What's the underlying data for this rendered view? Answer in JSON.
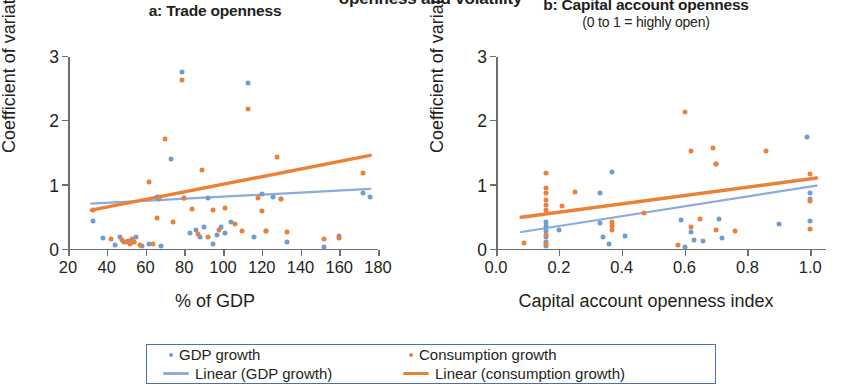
{
  "figure": {
    "supertitle": "openness and volatility",
    "colors": {
      "gdp_growth": "#6f9bd6",
      "consumption_growth": "#ed8037",
      "gdp_trend": "#89abdd",
      "consumption_trend": "#ed8037",
      "axis": "#6d6e71",
      "legend_border": "#4a70b0"
    }
  },
  "legend": {
    "items": [
      {
        "label": "GDP growth",
        "marker": "dot",
        "color": "#6f9bd6"
      },
      {
        "label": "Consumption growth",
        "marker": "dot",
        "color": "#ed8037"
      },
      {
        "label": "Linear (GDP growth)",
        "marker": "line",
        "color": "#89abdd"
      },
      {
        "label": "Linear (consumption growth)",
        "marker": "line",
        "color": "#ed8037"
      }
    ]
  },
  "chart_data": [
    {
      "type": "scatter",
      "panel": "a",
      "title": "a: Trade openness",
      "subtitle": "",
      "xlabel": "% of GDP",
      "ylabel": "Coefficient of variation",
      "xlim": [
        20,
        180
      ],
      "ylim": [
        0,
        3
      ],
      "xticks": [
        20,
        40,
        60,
        80,
        100,
        120,
        140,
        160,
        180
      ],
      "xticklabels": [
        "20",
        "40",
        "60",
        "80",
        "100",
        "120",
        "140",
        "160",
        "180"
      ],
      "yticks": [
        0,
        1,
        2,
        3
      ],
      "yticklabels": [
        "0",
        "1",
        "2",
        "3"
      ],
      "grid": false,
      "series": [
        {
          "name": "GDP growth",
          "color": "#6f9bd6",
          "points": [
            [
              33,
              0.45
            ],
            [
              38,
              0.18
            ],
            [
              44,
              0.08
            ],
            [
              47,
              0.21
            ],
            [
              49,
              0.13
            ],
            [
              51,
              0.14
            ],
            [
              52,
              0.11
            ],
            [
              54,
              0.12
            ],
            [
              55,
              0.2
            ],
            [
              58,
              0.07
            ],
            [
              62,
              0.1
            ],
            [
              66,
              0.83
            ],
            [
              67,
              0.8
            ],
            [
              68,
              0.06
            ],
            [
              73,
              1.42
            ],
            [
              79,
              2.77
            ],
            [
              80,
              0.81
            ],
            [
              83,
              0.27
            ],
            [
              86,
              0.31
            ],
            [
              88,
              0.2
            ],
            [
              90,
              0.36
            ],
            [
              92,
              0.81
            ],
            [
              95,
              0.09
            ],
            [
              97,
              0.23
            ],
            [
              99,
              0.35
            ],
            [
              101,
              0.26
            ],
            [
              104,
              0.44
            ],
            [
              113,
              2.6
            ],
            [
              116,
              0.2
            ],
            [
              120,
              0.87
            ],
            [
              122,
              0.3
            ],
            [
              126,
              0.83
            ],
            [
              130,
              0.8
            ],
            [
              133,
              0.12
            ],
            [
              152,
              0.04
            ],
            [
              160,
              0.22
            ],
            [
              172,
              0.89
            ],
            [
              176,
              0.82
            ]
          ]
        },
        {
          "name": "Consumption growth",
          "color": "#ed8037",
          "points": [
            [
              33,
              0.62
            ],
            [
              42,
              0.17
            ],
            [
              48,
              0.15
            ],
            [
              50,
              0.12
            ],
            [
              52,
              0.1
            ],
            [
              53,
              0.17
            ],
            [
              54,
              0.13
            ],
            [
              57,
              0.08
            ],
            [
              62,
              1.05
            ],
            [
              64,
              0.09
            ],
            [
              66,
              0.49
            ],
            [
              67,
              0.82
            ],
            [
              70,
              1.73
            ],
            [
              74,
              0.43
            ],
            [
              79,
              2.64
            ],
            [
              80,
              0.81
            ],
            [
              84,
              0.64
            ],
            [
              87,
              0.25
            ],
            [
              89,
              1.25
            ],
            [
              92,
              0.2
            ],
            [
              95,
              0.62
            ],
            [
              98,
              0.31
            ],
            [
              101,
              0.66
            ],
            [
              106,
              0.41
            ],
            [
              110,
              0.29
            ],
            [
              113,
              2.19
            ],
            [
              118,
              0.81
            ],
            [
              120,
              0.6
            ],
            [
              122,
              0.3
            ],
            [
              128,
              1.45
            ],
            [
              130,
              0.8
            ],
            [
              133,
              0.28
            ],
            [
              152,
              0.17
            ],
            [
              160,
              0.18
            ],
            [
              172,
              1.2
            ]
          ]
        }
      ],
      "trendlines": [
        {
          "name": "Linear (GDP growth)",
          "color": "#89abdd",
          "x0": 32,
          "y0": 0.72,
          "x1": 176,
          "y1": 0.95
        },
        {
          "name": "Linear (consumption growth)",
          "color": "#ed8037",
          "x0": 32,
          "y0": 0.62,
          "x1": 176,
          "y1": 1.47
        }
      ]
    },
    {
      "type": "scatter",
      "panel": "b",
      "title": "b: Capital account openness",
      "subtitle": "(0 to 1 = highly open)",
      "xlabel": "Capital account openness index",
      "ylabel": "Coefficient of variation",
      "xlim": [
        0.0,
        1.05
      ],
      "ylim": [
        0,
        3
      ],
      "xticks": [
        0.0,
        0.2,
        0.4,
        0.6,
        0.8,
        1.0
      ],
      "xticklabels": [
        "0.0",
        "0.2",
        "0.4",
        "0.6",
        "0.8",
        "1.0"
      ],
      "yticks": [
        0,
        1,
        2,
        3
      ],
      "yticklabels": [
        "0",
        "1",
        "2",
        "3"
      ],
      "grid": false,
      "series": [
        {
          "name": "GDP growth",
          "color": "#6f9bd6",
          "points": [
            [
              0.16,
              0.44
            ],
            [
              0.16,
              0.38
            ],
            [
              0.16,
              0.3
            ],
            [
              0.16,
              0.21
            ],
            [
              0.16,
              0.12
            ],
            [
              0.16,
              0.07
            ],
            [
              0.2,
              0.31
            ],
            [
              0.33,
              0.88
            ],
            [
              0.33,
              0.42
            ],
            [
              0.34,
              0.2
            ],
            [
              0.36,
              0.1
            ],
            [
              0.41,
              0.22
            ],
            [
              0.37,
              1.21
            ],
            [
              0.59,
              0.46
            ],
            [
              0.6,
              0.05
            ],
            [
              0.62,
              0.28
            ],
            [
              0.63,
              0.16
            ],
            [
              0.66,
              0.14
            ],
            [
              0.7,
              1.33
            ],
            [
              0.71,
              0.48
            ],
            [
              0.72,
              0.19
            ],
            [
              0.9,
              0.41
            ],
            [
              0.99,
              1.75
            ],
            [
              1.0,
              0.88
            ],
            [
              1.0,
              0.8
            ],
            [
              1.0,
              0.45
            ]
          ]
        },
        {
          "name": "Consumption growth",
          "color": "#ed8037",
          "points": [
            [
              0.09,
              0.11
            ],
            [
              0.16,
              1.19
            ],
            [
              0.16,
              0.96
            ],
            [
              0.16,
              0.88
            ],
            [
              0.16,
              0.78
            ],
            [
              0.16,
              0.7
            ],
            [
              0.16,
              0.62
            ],
            [
              0.16,
              0.24
            ],
            [
              0.16,
              0.09
            ],
            [
              0.21,
              0.68
            ],
            [
              0.25,
              0.9
            ],
            [
              0.37,
              0.44
            ],
            [
              0.37,
              0.38
            ],
            [
              0.37,
              0.31
            ],
            [
              0.47,
              0.58
            ],
            [
              0.58,
              0.08
            ],
            [
              0.6,
              2.15
            ],
            [
              0.62,
              0.36
            ],
            [
              0.62,
              1.54
            ],
            [
              0.65,
              0.48
            ],
            [
              0.69,
              1.58
            ],
            [
              0.7,
              1.34
            ],
            [
              0.7,
              0.31
            ],
            [
              0.76,
              0.3
            ],
            [
              0.86,
              1.54
            ],
            [
              1.0,
              0.76
            ],
            [
              1.0,
              0.33
            ],
            [
              1.0,
              1.18
            ]
          ]
        }
      ],
      "trendlines": [
        {
          "name": "Linear (GDP growth)",
          "color": "#89abdd",
          "x0": 0.08,
          "y0": 0.28,
          "x1": 1.02,
          "y1": 1.0
        },
        {
          "name": "Linear (consumption growth)",
          "color": "#ed8037",
          "x0": 0.08,
          "y0": 0.51,
          "x1": 1.02,
          "y1": 1.12
        }
      ]
    }
  ]
}
